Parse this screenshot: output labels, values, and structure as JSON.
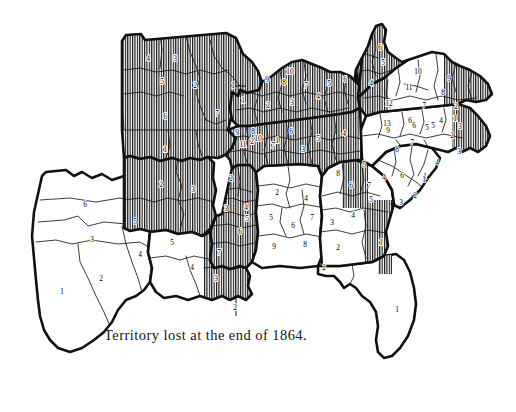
{
  "figure": {
    "caption": "Territory lost at the end of 1864.",
    "title": "Territory lost at the end of 1864.",
    "type": "thematic-historical-map",
    "background_color": "#ffffff",
    "ink_color": "#111111",
    "hatch_meaning": "vertical line hatching marks territory lost",
    "plain_meaning": "unhatched white area marks territory still held"
  },
  "legend": {
    "hatched_label": "Territory lost at the end of 1864.",
    "hatch_pattern": "vertical-lines",
    "hatch_color": "#111111",
    "hatch_spacing_px": 2.4
  },
  "states": [
    {
      "name": "Texas",
      "abbr": "TX",
      "status": "held",
      "hatched": false,
      "districts": [
        {
          "number": "1",
          "x": 62,
          "y": 292,
          "hatched": false
        },
        {
          "number": "2",
          "x": 101,
          "y": 279,
          "hatched": false
        },
        {
          "number": "3",
          "x": 92,
          "y": 240,
          "hatched": false
        },
        {
          "number": "4",
          "x": 140,
          "y": 255,
          "hatched": false
        },
        {
          "number": "5",
          "x": 135,
          "y": 222,
          "hatched": false
        },
        {
          "number": "6",
          "x": 85,
          "y": 205,
          "hatched": false
        }
      ]
    },
    {
      "name": "Missouri",
      "abbr": "MO",
      "status": "lost",
      "hatched": true,
      "districts": [
        {
          "number": "1",
          "x": 233,
          "y": 86,
          "hatched": false
        },
        {
          "number": "2",
          "x": 195,
          "y": 86,
          "hatched": true
        },
        {
          "number": "3",
          "x": 175,
          "y": 59,
          "hatched": true
        },
        {
          "number": "4",
          "x": 148,
          "y": 59,
          "hatched": true
        },
        {
          "number": "5",
          "x": 162,
          "y": 82,
          "hatched": true
        },
        {
          "number": "6",
          "x": 165,
          "y": 117,
          "hatched": true
        },
        {
          "number": "7",
          "x": 217,
          "y": 114,
          "hatched": true
        }
      ]
    },
    {
      "name": "Arkansas",
      "abbr": "AR",
      "status": "lost",
      "hatched": true,
      "districts": [
        {
          "number": "1",
          "x": 165,
          "y": 150,
          "hatched": true
        },
        {
          "number": "2",
          "x": 161,
          "y": 185,
          "hatched": true
        },
        {
          "number": "3",
          "x": 193,
          "y": 190,
          "hatched": true
        }
      ]
    },
    {
      "name": "Louisiana",
      "abbr": "LA",
      "status": "mixed",
      "hatched": false,
      "districts": [
        {
          "number": "2",
          "x": 235,
          "y": 308,
          "hatched": true,
          "leader": true
        },
        {
          "number": "3",
          "x": 216,
          "y": 279,
          "hatched": true
        },
        {
          "number": "4",
          "x": 192,
          "y": 268,
          "hatched": false
        },
        {
          "number": "5",
          "x": 172,
          "y": 243,
          "hatched": false
        }
      ]
    },
    {
      "name": "Mississippi",
      "abbr": "MS",
      "status": "lost",
      "hatched": true,
      "districts": [
        {
          "number": "2",
          "x": 231,
          "y": 179,
          "hatched": true
        },
        {
          "number": "3",
          "x": 226,
          "y": 209,
          "hatched": true
        },
        {
          "number": "4",
          "x": 246,
          "y": 208,
          "hatched": true
        },
        {
          "number": "5",
          "x": 247,
          "y": 219,
          "hatched": true
        },
        {
          "number": "6",
          "x": 240,
          "y": 232,
          "hatched": true
        },
        {
          "number": "7",
          "x": 219,
          "y": 253,
          "hatched": true
        }
      ]
    },
    {
      "name": "Alabama",
      "abbr": "AL",
      "status": "held",
      "hatched": false,
      "districts": [
        {
          "number": "2",
          "x": 277,
          "y": 193,
          "hatched": false
        },
        {
          "number": "4",
          "x": 306,
          "y": 199,
          "hatched": false
        },
        {
          "number": "5",
          "x": 271,
          "y": 218,
          "hatched": false
        },
        {
          "number": "6",
          "x": 293,
          "y": 226,
          "hatched": false
        },
        {
          "number": "7",
          "x": 312,
          "y": 218,
          "hatched": false
        },
        {
          "number": "8",
          "x": 305,
          "y": 245,
          "hatched": false
        },
        {
          "number": "9",
          "x": 274,
          "y": 247,
          "hatched": false
        }
      ]
    },
    {
      "name": "Florida",
      "abbr": "FL",
      "status": "held",
      "hatched": false,
      "districts": [
        {
          "number": "1",
          "x": 397,
          "y": 310,
          "hatched": false
        },
        {
          "number": "2",
          "x": 324,
          "y": 268,
          "hatched": false
        }
      ]
    },
    {
      "name": "Georgia",
      "abbr": "GA",
      "status": "mixed",
      "hatched": false,
      "districts": [
        {
          "number": "1",
          "x": 381,
          "y": 243,
          "hatched": true
        },
        {
          "number": "2",
          "x": 338,
          "y": 248,
          "hatched": false
        },
        {
          "number": "3",
          "x": 332,
          "y": 223,
          "hatched": false
        },
        {
          "number": "4",
          "x": 353,
          "y": 216,
          "hatched": true
        },
        {
          "number": "5",
          "x": 371,
          "y": 200,
          "hatched": true
        },
        {
          "number": "6",
          "x": 351,
          "y": 186,
          "hatched": true
        },
        {
          "number": "7",
          "x": 369,
          "y": 186,
          "hatched": false
        },
        {
          "number": "8",
          "x": 338,
          "y": 174,
          "hatched": true
        }
      ]
    },
    {
      "name": "South Carolina",
      "abbr": "SC",
      "status": "held",
      "hatched": false,
      "districts": [
        {
          "number": "1",
          "x": 425,
          "y": 177,
          "hatched": false
        },
        {
          "number": "2",
          "x": 415,
          "y": 196,
          "hatched": false
        },
        {
          "number": "3",
          "x": 401,
          "y": 203,
          "hatched": false
        },
        {
          "number": "4",
          "x": 384,
          "y": 178,
          "hatched": false
        },
        {
          "number": "5",
          "x": 364,
          "y": 165,
          "hatched": false
        },
        {
          "number": "6",
          "x": 402,
          "y": 176,
          "hatched": false
        }
      ]
    },
    {
      "name": "North Carolina",
      "abbr": "NC",
      "status": "held",
      "hatched": false,
      "districts": [
        {
          "number": "1",
          "x": 424,
          "y": 180,
          "hatched": false
        },
        {
          "number": "2",
          "x": 452,
          "y": 136,
          "hatched": false
        },
        {
          "number": "3",
          "x": 459,
          "y": 152,
          "hatched": true
        },
        {
          "number": "4",
          "x": 437,
          "y": 163,
          "hatched": false
        },
        {
          "number": "5",
          "x": 433,
          "y": 126,
          "hatched": false
        },
        {
          "number": "6",
          "x": 414,
          "y": 126,
          "hatched": false
        },
        {
          "number": "7",
          "x": 412,
          "y": 143,
          "hatched": false
        },
        {
          "number": "8",
          "x": 397,
          "y": 150,
          "hatched": false
        },
        {
          "number": "9",
          "x": 388,
          "y": 131,
          "hatched": false
        }
      ]
    },
    {
      "name": "Virginia",
      "abbr": "VA",
      "status": "mixed",
      "hatched": true,
      "districts": [
        {
          "number": "1",
          "x": 455,
          "y": 119,
          "hatched": true
        },
        {
          "number": "2",
          "x": 456,
          "y": 107,
          "hatched": true
        },
        {
          "number": "3",
          "x": 460,
          "y": 127,
          "hatched": true
        },
        {
          "number": "4",
          "x": 441,
          "y": 121,
          "hatched": false
        },
        {
          "number": "5",
          "x": 427,
          "y": 128,
          "hatched": false
        },
        {
          "number": "6",
          "x": 410,
          "y": 121,
          "hatched": false
        },
        {
          "number": "7",
          "x": 424,
          "y": 106,
          "hatched": false
        },
        {
          "number": "8",
          "x": 443,
          "y": 93,
          "hatched": false
        },
        {
          "number": "9",
          "x": 449,
          "y": 79,
          "hatched": false
        },
        {
          "number": "10",
          "x": 418,
          "y": 72,
          "hatched": false
        },
        {
          "number": "11",
          "x": 409,
          "y": 88,
          "hatched": false
        },
        {
          "number": "12",
          "x": 389,
          "y": 104,
          "hatched": true
        },
        {
          "number": "13",
          "x": 387,
          "y": 124,
          "hatched": true
        }
      ]
    },
    {
      "name": "West Virginia",
      "abbr": "WV",
      "status": "lost",
      "hatched": true,
      "districts": [
        {
          "number": "4",
          "x": 371,
          "y": 84,
          "hatched": true
        },
        {
          "number": "5",
          "x": 383,
          "y": 63,
          "hatched": true
        },
        {
          "number": "6",
          "x": 380,
          "y": 48,
          "hatched": true
        }
      ]
    },
    {
      "name": "Kentucky",
      "abbr": "KY",
      "status": "lost",
      "hatched": true,
      "districts": [
        {
          "number": "1",
          "x": 243,
          "y": 101,
          "hatched": true
        },
        {
          "number": "2",
          "x": 268,
          "y": 106,
          "hatched": true
        },
        {
          "number": "3",
          "x": 292,
          "y": 103,
          "hatched": true
        },
        {
          "number": "4",
          "x": 318,
          "y": 97,
          "hatched": true
        },
        {
          "number": "5",
          "x": 329,
          "y": 84,
          "hatched": true
        },
        {
          "number": "6",
          "x": 345,
          "y": 80,
          "hatched": true
        },
        {
          "number": "7",
          "x": 306,
          "y": 86,
          "hatched": true
        },
        {
          "number": "8",
          "x": 284,
          "y": 83,
          "hatched": true
        },
        {
          "number": "9",
          "x": 267,
          "y": 80,
          "hatched": true
        },
        {
          "number": "10",
          "x": 290,
          "y": 72,
          "hatched": true
        }
      ]
    },
    {
      "name": "Tennessee",
      "abbr": "TN",
      "status": "lost",
      "hatched": true,
      "districts": [
        {
          "number": "1",
          "x": 277,
          "y": 141,
          "hatched": true
        },
        {
          "number": "2",
          "x": 252,
          "y": 142,
          "hatched": true
        },
        {
          "number": "3",
          "x": 303,
          "y": 150,
          "hatched": true
        },
        {
          "number": "4",
          "x": 344,
          "y": 134,
          "hatched": true
        },
        {
          "number": "5",
          "x": 318,
          "y": 139,
          "hatched": true
        },
        {
          "number": "6",
          "x": 291,
          "y": 132,
          "hatched": true
        },
        {
          "number": "7",
          "x": 273,
          "y": 146,
          "hatched": true
        },
        {
          "number": "8",
          "x": 253,
          "y": 132,
          "hatched": true
        },
        {
          "number": "9",
          "x": 237,
          "y": 133,
          "hatched": true
        },
        {
          "number": "10",
          "x": 258,
          "y": 139,
          "hatched": true
        },
        {
          "number": "11",
          "x": 243,
          "y": 145,
          "hatched": true
        }
      ]
    }
  ]
}
